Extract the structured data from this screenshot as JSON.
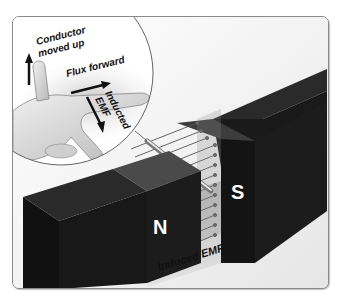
{
  "diagram": {
    "hand_labels": {
      "thumb": [
        "Conductor",
        "moved up"
      ],
      "forefinger": "Flux forward",
      "middle_finger": [
        "Inducted",
        "EMF"
      ]
    },
    "magnets": {
      "north_label": "N",
      "south_label": "S"
    },
    "field_label": "Induced EMF",
    "colors": {
      "magnet": "#1e1e1e",
      "magnet_top": "#3a3a3a",
      "frame_border": "#8a8a8a",
      "background": "#ffffff",
      "skin": "#d9d9d9"
    }
  }
}
